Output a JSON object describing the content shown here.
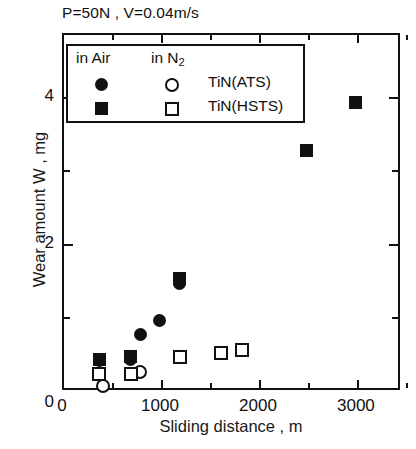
{
  "figure": {
    "title": "P=50N , V=0.04m/s"
  },
  "axes": {
    "x": {
      "label": "Sliding distance , m",
      "ticks": [
        "0",
        "1000",
        "2000",
        "3000"
      ],
      "tick_values": [
        0,
        1000,
        2000,
        3000
      ],
      "minor_tick_values": [
        500,
        1500,
        2500,
        3500
      ],
      "range": [
        0,
        3450
      ]
    },
    "y": {
      "label": "Wear amount W , mg",
      "ticks": [
        "0",
        "2",
        "4"
      ],
      "tick_values": [
        0,
        2,
        4
      ],
      "minor_tick_values": [
        1,
        3
      ],
      "range": [
        0,
        4.85
      ]
    }
  },
  "legend": {
    "header_air": "in Air",
    "header_n2_text": "in N",
    "header_n2_sub": "2",
    "rows": [
      {
        "air_marker": "filled-circle",
        "n2_marker": "open-circle",
        "label": "TiN(ATS)"
      },
      {
        "air_marker": "filled-square",
        "n2_marker": "open-square",
        "label": "TiN(HSTS)"
      }
    ]
  },
  "chart_data": {
    "type": "scatter",
    "title": "P=50N , V=0.04m/s",
    "xlabel": "Sliding distance , m",
    "ylabel": "Wear amount W , mg",
    "xlim": [
      0,
      3450
    ],
    "ylim": [
      0,
      4.85
    ],
    "grid": false,
    "legend_position": "upper-left-inside",
    "series": [
      {
        "name": "TiN(ATS) in Air",
        "marker": "filled-circle",
        "points": [
          {
            "x": 380,
            "y": 0.4
          },
          {
            "x": 700,
            "y": 0.42
          },
          {
            "x": 800,
            "y": 0.75
          },
          {
            "x": 1000,
            "y": 0.95
          },
          {
            "x": 1200,
            "y": 1.45
          }
        ]
      },
      {
        "name": "TiN(ATS) in N2",
        "marker": "open-circle",
        "points": [
          {
            "x": 420,
            "y": 0.05
          },
          {
            "x": 800,
            "y": 0.25
          }
        ]
      },
      {
        "name": "TiN(HSTS) in Air",
        "marker": "filled-square",
        "points": [
          {
            "x": 380,
            "y": 0.42
          },
          {
            "x": 700,
            "y": 0.45
          },
          {
            "x": 1200,
            "y": 1.52
          },
          {
            "x": 2500,
            "y": 3.25
          },
          {
            "x": 3000,
            "y": 3.9
          }
        ]
      },
      {
        "name": "TiN(HSTS) in N2",
        "marker": "open-square",
        "points": [
          {
            "x": 380,
            "y": 0.22
          },
          {
            "x": 700,
            "y": 0.22
          },
          {
            "x": 1200,
            "y": 0.45
          },
          {
            "x": 1620,
            "y": 0.5
          },
          {
            "x": 1840,
            "y": 0.55
          }
        ]
      }
    ]
  }
}
